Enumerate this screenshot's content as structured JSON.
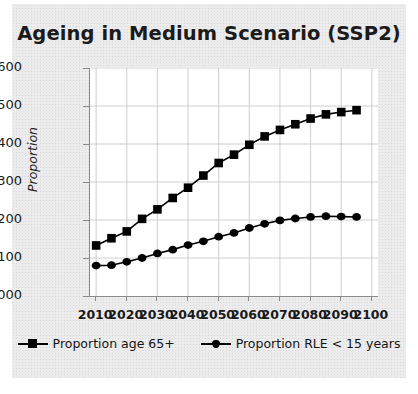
{
  "figure": {
    "title": "Ageing in Medium Scenario (SSP2)",
    "background_color": "#ececed",
    "plot_background_color": "#ffffff",
    "ink_color": "#000000"
  },
  "chart_data": {
    "type": "line",
    "title": "Ageing in Medium Scenario (SSP2)",
    "xlabel": "",
    "ylabel": "Proportion",
    "xlim": [
      2008,
      2102
    ],
    "ylim": [
      0.0,
      0.6
    ],
    "grid": true,
    "legend_position": "bottom",
    "xticks": [
      "2010",
      "2020",
      "2030",
      "2040",
      "2050",
      "2060",
      "2070",
      "2080",
      "2090",
      "2100"
    ],
    "xtick_values": [
      2010,
      2020,
      2030,
      2040,
      2050,
      2060,
      2070,
      2080,
      2090,
      2100
    ],
    "yticks": [
      "0.000",
      "0.100",
      "0.200",
      "0.300",
      "0.400",
      "0.500",
      "0.600"
    ],
    "ytick_values": [
      0.0,
      0.1,
      0.2,
      0.3,
      0.4,
      0.5,
      0.6
    ],
    "x": [
      2010,
      2015,
      2020,
      2025,
      2030,
      2035,
      2040,
      2045,
      2050,
      2055,
      2060,
      2065,
      2070,
      2075,
      2080,
      2085,
      2090,
      2095
    ],
    "series": [
      {
        "name": "Proportion age 65+",
        "marker": "square",
        "color": "#000000",
        "values": [
          0.133,
          0.152,
          0.17,
          0.203,
          0.228,
          0.258,
          0.285,
          0.317,
          0.35,
          0.372,
          0.398,
          0.42,
          0.437,
          0.452,
          0.467,
          0.478,
          0.484,
          0.489
        ]
      },
      {
        "name": "Proportion RLE < 15 years",
        "marker": "diamond",
        "color": "#000000",
        "values": [
          0.08,
          0.081,
          0.09,
          0.1,
          0.112,
          0.122,
          0.134,
          0.144,
          0.156,
          0.166,
          0.179,
          0.19,
          0.199,
          0.204,
          0.208,
          0.21,
          0.209,
          0.208
        ]
      }
    ]
  }
}
